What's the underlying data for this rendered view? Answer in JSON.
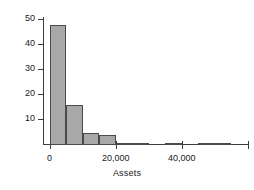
{
  "chart_data": {
    "type": "bar",
    "title": "",
    "subtitle": "",
    "xlabel": "Assets",
    "ylabel": "# of Companies",
    "categories": [
      0,
      5000,
      10000,
      15000,
      20000,
      25000,
      30000,
      35000,
      40000,
      45000,
      50000,
      55000
    ],
    "values": [
      48,
      16,
      5,
      4,
      1,
      1,
      0,
      1,
      0,
      1,
      1,
      0
    ],
    "bin_width": 5000,
    "xlim": [
      -2000,
      60000
    ],
    "ylim": [
      0,
      52
    ],
    "xticks": [
      0,
      20000,
      40000,
      60000
    ],
    "xtick_labels": [
      "0",
      "20,000",
      "40,000",
      ""
    ],
    "yticks": [
      10,
      20,
      30,
      40,
      50
    ],
    "ytick_labels": [
      "10",
      "20",
      "30",
      "40",
      "50"
    ],
    "grid": false,
    "legend": false,
    "bar_fill_color": "#a8a8a8",
    "bar_edge_color": "#4a4a4a",
    "axis_color": "#3d3d3d"
  }
}
